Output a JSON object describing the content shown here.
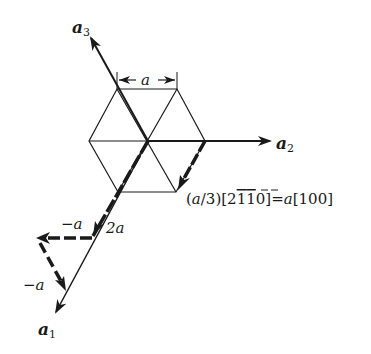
{
  "figure": {
    "axes": {
      "a1": {
        "label": "a",
        "subscript": "1"
      },
      "a2": {
        "label": "a",
        "subscript": "2"
      },
      "a3": {
        "label": "a",
        "subscript": "3"
      }
    },
    "dimension": {
      "label": "a"
    },
    "equation": {
      "prefix": "(",
      "var": "a",
      "after_var": "/3)[2",
      "bar1": "1",
      "bar2": "1",
      "mid": "0]=",
      "var2": "a",
      "suffix": "[100]"
    },
    "path_labels": {
      "two_a": "2a",
      "minus_a_top": "−a",
      "minus_a_left": "−a"
    }
  },
  "colors": {
    "ink": "#1a1a1a",
    "background": "#ffffff"
  }
}
